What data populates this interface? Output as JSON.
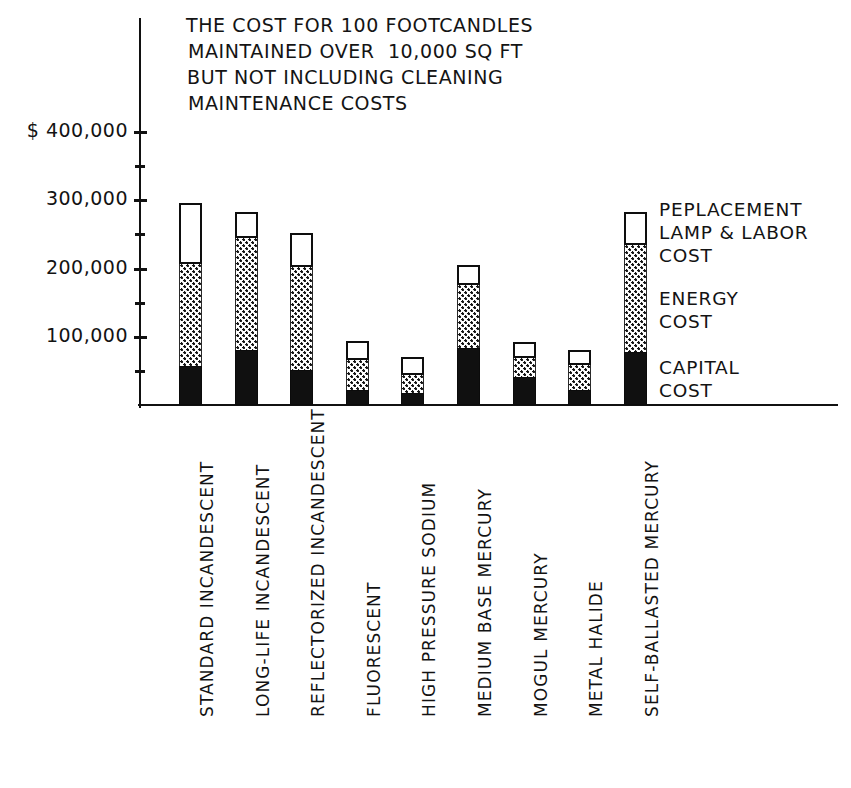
{
  "title": {
    "lines": [
      "THE COST FOR 100 FOOTCANDLES",
      "MAINTAINED OVER  10,000 SQ FT",
      "BUT NOT INCLUDING CLEANING",
      "MAINTENANCE COSTS"
    ]
  },
  "axis": {
    "y_tick_labels": [
      "$ 400,000",
      "300,000",
      "200,000",
      "100,000"
    ],
    "y_tick_values": [
      400000,
      300000,
      200000,
      100000
    ],
    "y_minor_values": [
      350000,
      250000,
      150000,
      50000
    ]
  },
  "legend": {
    "entries": [
      {
        "name": "replacement",
        "lines": [
          "PEPLACEMENT",
          "LAMP & LABOR",
          "COST"
        ]
      },
      {
        "name": "energy",
        "lines": [
          "ENERGY",
          "COST"
        ]
      },
      {
        "name": "capital",
        "lines": [
          "CAPITAL",
          "COST"
        ]
      }
    ]
  },
  "chart_data": {
    "type": "bar",
    "title": "THE COST FOR 100 FOOTCANDLES MAINTAINED OVER 10,000 SQ FT BUT NOT INCLUDING CLEANING MAINTENANCE COSTS",
    "xlabel": "",
    "ylabel": "$",
    "ylim": [
      0,
      420000
    ],
    "grid": false,
    "stacked": true,
    "legend_position": "right",
    "categories": [
      "STANDARD INCANDESCENT",
      "LONG-LIFE INCANDESCENT",
      "REFLECTORIZED INCANDESCENT",
      "FLUORESCENT",
      "HIGH PRESSURE SODIUM",
      "MEDIUM BASE MERCURY",
      "MOGUL MERCURY",
      "METAL HALIDE",
      "SELF-BALLASTED MERCURY"
    ],
    "series": [
      {
        "name": "CAPITAL COST",
        "values": [
          57000,
          81000,
          51000,
          22000,
          18000,
          84000,
          41000,
          22000,
          78000
        ]
      },
      {
        "name": "ENERGY COST",
        "values": [
          150000,
          164000,
          151000,
          44000,
          26000,
          92000,
          28000,
          37000,
          157000
        ]
      },
      {
        "name": "PEPLACEMENT LAMP & LABOR COST",
        "values": [
          89000,
          38000,
          50000,
          28000,
          26000,
          29000,
          23000,
          21000,
          48000
        ]
      }
    ],
    "totals": [
      296000,
      283000,
      252000,
      94000,
      70000,
      205000,
      92000,
      80000,
      283000
    ]
  }
}
